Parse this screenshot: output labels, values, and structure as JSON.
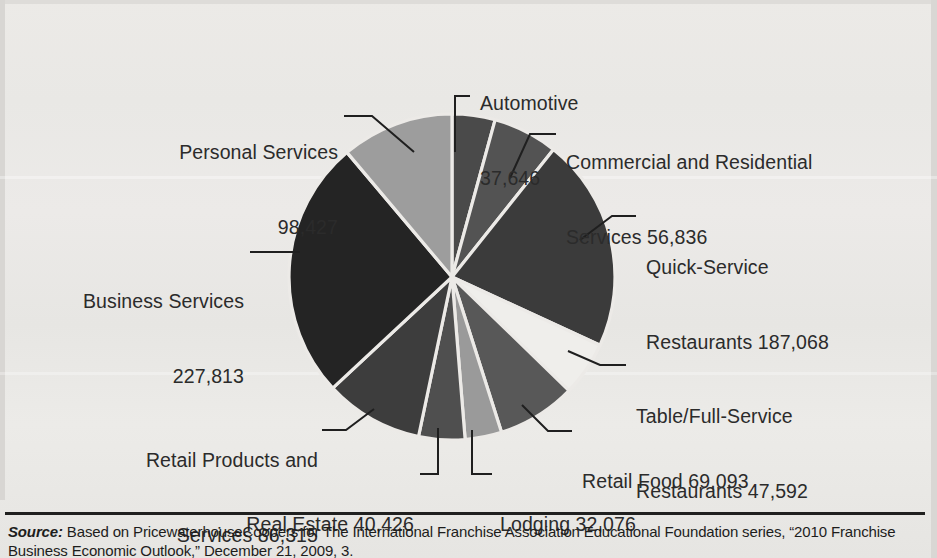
{
  "figure": {
    "kind": "pie-chart-figure",
    "background_color": "#e9e8e5",
    "ink_color": "#2b2b2b"
  },
  "source": {
    "label": "Source:",
    "text": " Based on PricewaterhouseCoopers for The International Franchise Association Educational Foundation series, “2010 Franchise Business Economic Outlook,” December 21, 2009, 3."
  },
  "chart_data": {
    "type": "pie",
    "title": "",
    "total": 883292,
    "start_angle_deg": 0,
    "direction": "clockwise",
    "legend": "none-labels-with-leader-lines",
    "categories": [
      "Automotive",
      "Commercial and Residential Services",
      "Quick-Service Restaurants",
      "Table/Full-Service Restaurants",
      "Retail Food",
      "Lodging",
      "Real Estate",
      "Retail Products and Services",
      "Business Services",
      "Personal Services"
    ],
    "values": [
      37646,
      56836,
      187068,
      47592,
      69093,
      32076,
      40426,
      86315,
      227813,
      98427
    ],
    "colors": [
      "#4a4a4a",
      "#535353",
      "#3b3b3b",
      "#efeeeb",
      "#585858",
      "#9a9a9a",
      "#4f4f4f",
      "#3d3d3d",
      "#242424",
      "#9d9d9d"
    ],
    "slices": [
      {
        "name": "Automotive",
        "value": "37,646",
        "color": "#4a4a4a",
        "angle_deg": 15.3
      },
      {
        "name": "Commercial and Residential Services",
        "value": "56,836",
        "color": "#535353",
        "angle_deg": 23.2
      },
      {
        "name": "Quick-Service Restaurants",
        "value": "187,068",
        "color": "#3b3b3b",
        "angle_deg": 76.2
      },
      {
        "name": "Table/Full-Service Restaurants",
        "value": "47,592",
        "color": "#efeeeb",
        "angle_deg": 19.4
      },
      {
        "name": "Retail Food",
        "value": "69,093",
        "color": "#585858",
        "angle_deg": 28.2
      },
      {
        "name": "Lodging",
        "value": "32,076",
        "color": "#9a9a9a",
        "angle_deg": 13.1
      },
      {
        "name": "Real Estate",
        "value": "40,426",
        "color": "#4f4f4f",
        "angle_deg": 16.5
      },
      {
        "name": "Retail Products and Services",
        "value": "86,315",
        "color": "#3d3d3d",
        "angle_deg": 35.2
      },
      {
        "name": "Business Services",
        "value": "227,813",
        "color": "#242424",
        "angle_deg": 92.9
      },
      {
        "name": "Personal Services",
        "value": "98,427",
        "color": "#9d9d9d",
        "angle_deg": 40.1
      }
    ]
  },
  "labels": {
    "automotive": {
      "line1": "Automotive",
      "line2": "37,646"
    },
    "commercial": {
      "line1": "Commercial and Residential",
      "line2": "Services 56,836"
    },
    "quick_service": {
      "line1": "Quick-Service",
      "line2": "Restaurants 187,068"
    },
    "table_service": {
      "line1": "Table/Full-Service",
      "line2": "Restaurants 47,592"
    },
    "retail_food": {
      "line1": "Retail Food 69,093"
    },
    "lodging": {
      "line1": "Lodging 32,076"
    },
    "real_estate": {
      "line1": "Real Estate 40,426"
    },
    "retail_products": {
      "line1": "Retail Products and",
      "line2": "Services 86,315"
    },
    "business_services": {
      "line1": "Business Services",
      "line2": "227,813"
    },
    "personal_services": {
      "line1": "Personal Services",
      "line2": "98,427"
    }
  }
}
